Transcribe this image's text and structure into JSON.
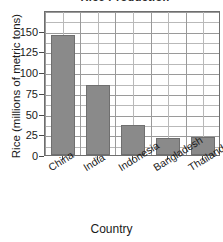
{
  "chart_data": {
    "type": "bar",
    "title": "Rice Production",
    "categories": [
      "China",
      "India",
      "Indonesia",
      "Bangladesh",
      "Thailand"
    ],
    "values": [
      145,
      84,
      36,
      21,
      22
    ],
    "xlabel": "Country",
    "ylabel": "Rice (millions of metric tons)",
    "ylim": [
      0,
      175
    ],
    "yticks": [
      0,
      25,
      50,
      75,
      100,
      125,
      150
    ],
    "ytick_labels": [
      "0",
      "25",
      "50",
      "75",
      "100",
      "125",
      "150"
    ],
    "grid": "both-major-and-minor",
    "legend": "none",
    "bar_color": "#8a8a8a",
    "bar_edge_color": "#6f6f6f",
    "grid_color": "#9a9a9a",
    "axis_color": "#6e6e6e"
  }
}
